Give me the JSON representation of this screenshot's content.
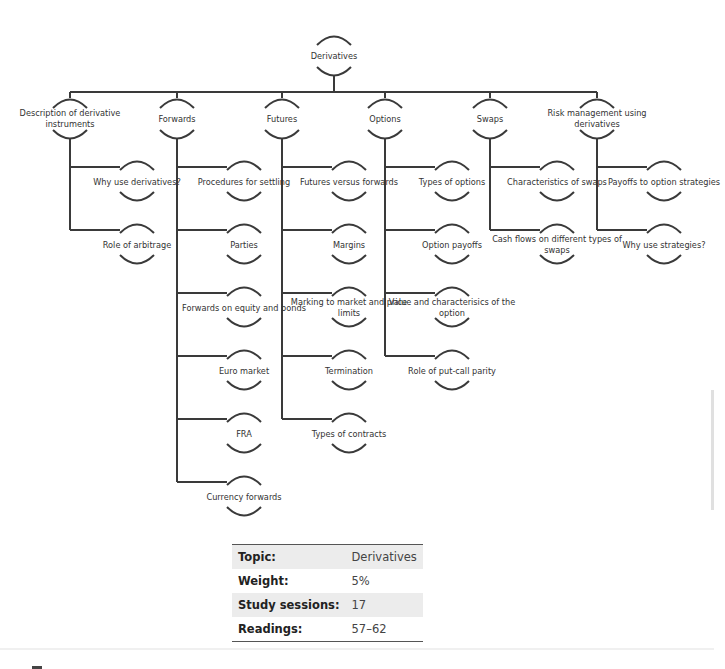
{
  "diagram": {
    "root": "Derivatives",
    "branches": [
      {
        "label": "Description of derivative instruments",
        "children": [
          "Why use derivatives?",
          "Role of arbitrage"
        ]
      },
      {
        "label": "Forwards",
        "children": [
          "Procedures for settling",
          "Parties",
          "Forwards on equity and bonds",
          "Euro market",
          "FRA",
          "Currency forwards"
        ]
      },
      {
        "label": "Futures",
        "children": [
          "Futures versus forwards",
          "Margins",
          "Marking to market and price limits",
          "Termination",
          "Types of contracts"
        ]
      },
      {
        "label": "Options",
        "children": [
          "Types of options",
          "Option payoffs",
          "Value and characterisics of the option",
          "Role of put-call parity"
        ]
      },
      {
        "label": "Swaps",
        "children": [
          "Characteristics of swaps",
          "Cash flows on different types of swaps"
        ]
      },
      {
        "label": "Risk management using derivatives",
        "children": [
          "Payoffs to option strategies",
          "Why use strategies?"
        ]
      }
    ]
  },
  "info_table": {
    "rows": [
      {
        "key": "Topic:",
        "value": "Derivatives"
      },
      {
        "key": "Weight:",
        "value": "5%"
      },
      {
        "key": "Study sessions:",
        "value": "17"
      },
      {
        "key": "Readings:",
        "value": "57–62"
      }
    ]
  },
  "colors": {
    "line": "#3a3a3a",
    "table_stripe": "#ececec"
  }
}
